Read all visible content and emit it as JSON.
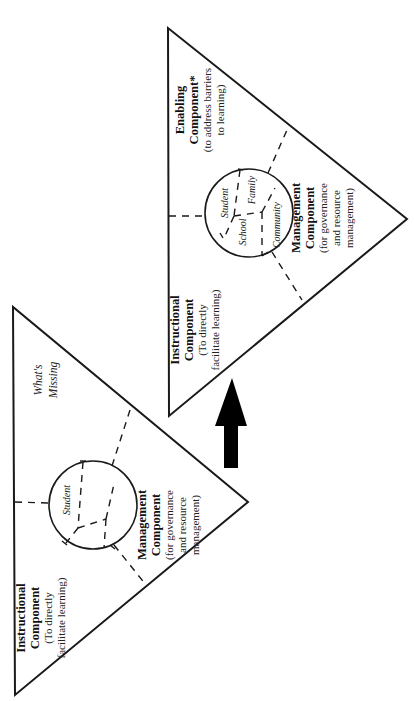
{
  "figure": {
    "orientation": "rotated 90 degrees counterclockwise",
    "arrow": {
      "direction": "from left diagram to right diagram",
      "color": "#000000"
    },
    "left_diagram": {
      "instructional": {
        "title1": "Instructional",
        "title2": "Component",
        "desc1": "(To directly",
        "desc2": "facilitate learning)"
      },
      "management": {
        "title1": "Management",
        "title2": "Component",
        "desc1": "(for governance",
        "desc2": "and resource",
        "desc3": "management)"
      },
      "missing": {
        "line1": "What's",
        "line2": "Missing"
      },
      "circle": {
        "student": "Student"
      }
    },
    "right_diagram": {
      "instructional": {
        "title1": "Instructional",
        "title2": "Component",
        "desc1": "(To directly",
        "desc2": "facilitate learning)"
      },
      "enabling": {
        "title1": "Enabling",
        "title2": "Component*",
        "desc1": "(to address barriers",
        "desc2": "to learning)"
      },
      "management": {
        "title1": "Management",
        "title2": "Component",
        "desc1": "(for governance",
        "desc2": "and resource",
        "desc3": "management)"
      },
      "circle": {
        "student": "Student",
        "school": "School",
        "family": "Family",
        "community": "Community"
      }
    }
  }
}
